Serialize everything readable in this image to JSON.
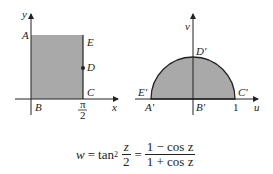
{
  "left_figure": {
    "axis_x_label": "x",
    "axis_y_label": "y",
    "points": {
      "A": "A",
      "B": "B",
      "C": "C",
      "D": "D",
      "E": "E"
    },
    "tick_x": {
      "numerator": "π",
      "denominator": "2"
    },
    "fill_color": "#a9a9a9"
  },
  "right_figure": {
    "axis_u_label": "u",
    "axis_v_label": "v",
    "points": {
      "A": "A'",
      "B": "B'",
      "C": "C'",
      "D": "D'",
      "E": "E'"
    },
    "tick_u": "1",
    "fill_color": "#a9a9a9"
  },
  "formula": {
    "lhs": "w",
    "eq1": "=",
    "func": "tan",
    "exp": "2",
    "frac1_num": "z",
    "frac1_den": "2",
    "eq2": "=",
    "frac2_num": "1 − cos z",
    "frac2_den": "1 + cos z"
  }
}
